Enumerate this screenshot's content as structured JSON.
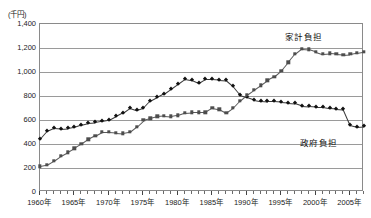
{
  "chart_data": {
    "type": "line",
    "title": "",
    "subtitle": "",
    "unit_label": "(千円)",
    "xlabel": "",
    "ylabel": "",
    "ylim": [
      0,
      1400
    ],
    "ytick_step": 200,
    "ytick_labels": [
      "1,400",
      "1,200",
      "1,000",
      "800",
      "600",
      "400",
      "200",
      "0"
    ],
    "ytick_values": [
      1400,
      1200,
      1000,
      800,
      600,
      400,
      200,
      0
    ],
    "xlim": [
      1960,
      2007
    ],
    "xtick_labels": [
      "1960年",
      "1965年",
      "1970年",
      "1975年",
      "1980年",
      "1985年",
      "1990年",
      "1995年",
      "2000年",
      "2005年"
    ],
    "xtick_values": [
      1960,
      1965,
      1970,
      1975,
      1980,
      1985,
      1990,
      1995,
      2000,
      2005
    ],
    "grid": true,
    "grid_axis": "y",
    "legend_position": "inline-annotation",
    "x": [
      1960,
      1961,
      1962,
      1963,
      1964,
      1965,
      1966,
      1967,
      1968,
      1969,
      1970,
      1971,
      1972,
      1973,
      1974,
      1975,
      1976,
      1977,
      1978,
      1979,
      1980,
      1981,
      1982,
      1983,
      1984,
      1985,
      1986,
      1987,
      1988,
      1989,
      1990,
      1991,
      1992,
      1993,
      1994,
      1995,
      1996,
      1997,
      1998,
      1999,
      2000,
      2001,
      2002,
      2003,
      2004,
      2005,
      2006,
      2007
    ],
    "series": [
      {
        "name": "政府負担",
        "marker": "diamond",
        "color": "#111111",
        "label_text": "政府負担",
        "values": [
          440,
          505,
          530,
          525,
          530,
          540,
          560,
          575,
          580,
          590,
          600,
          630,
          660,
          700,
          680,
          700,
          760,
          790,
          820,
          860,
          900,
          940,
          930,
          905,
          940,
          940,
          935,
          930,
          880,
          810,
          790,
          770,
          760,
          755,
          755,
          750,
          745,
          740,
          720,
          715,
          710,
          710,
          700,
          695,
          690,
          560,
          545,
          550
        ]
      },
      {
        "name": "家計負担",
        "marker": "square",
        "color": "#4d4d4d",
        "label_text": "家計負担",
        "values": [
          215,
          225,
          260,
          300,
          330,
          365,
          400,
          440,
          470,
          500,
          500,
          495,
          490,
          500,
          545,
          600,
          615,
          630,
          635,
          630,
          640,
          660,
          665,
          665,
          665,
          700,
          690,
          660,
          700,
          760,
          810,
          850,
          890,
          930,
          960,
          1010,
          1080,
          1150,
          1195,
          1190,
          1170,
          1150,
          1155,
          1150,
          1145,
          1150,
          1160,
          1170
        ]
      }
    ]
  }
}
